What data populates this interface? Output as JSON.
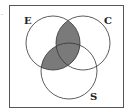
{
  "diagram": {
    "type": "venn",
    "sets": [
      {
        "id": "E",
        "label": "E"
      },
      {
        "id": "C",
        "label": "C"
      },
      {
        "id": "S",
        "label": "S"
      }
    ],
    "shaded_regions": [
      "E∩C",
      "E∩S"
    ],
    "colors": {
      "shade": "#7a7a7a",
      "stroke": "#333333",
      "background": "#ffffff"
    }
  }
}
